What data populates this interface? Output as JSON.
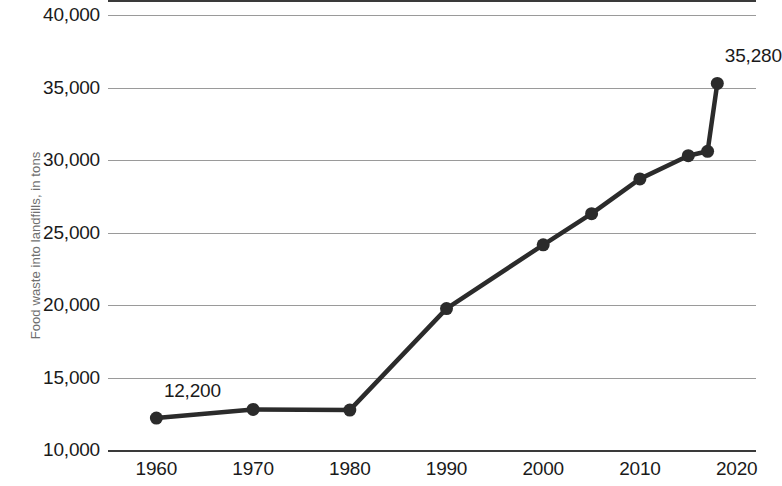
{
  "chart_data": {
    "type": "line",
    "title": "",
    "subtitle": "",
    "xlabel": "",
    "ylabel": "Food waste into landfills, in tons",
    "x": [
      1960,
      1970,
      1980,
      1990,
      2000,
      2005,
      2010,
      2015,
      2017,
      2018
    ],
    "values": [
      12200,
      12800,
      12750,
      19750,
      24150,
      26300,
      28700,
      30300,
      30600,
      35280
    ],
    "series": [
      {
        "name": "Food waste into landfills",
        "values": [
          12200,
          12800,
          12750,
          19750,
          24150,
          26300,
          28700,
          30300,
          30600,
          35280
        ]
      }
    ],
    "xlim": [
      1955,
      2022
    ],
    "ylim": [
      10000,
      40000
    ],
    "grid": true,
    "legend": false,
    "legend_position": "none",
    "line_color": "#2b2b2b",
    "marker": "circle",
    "y_ticks": [
      "10,000",
      "15,000",
      "20,000",
      "25,000",
      "30,000",
      "35,000",
      "40,000"
    ],
    "y_tick_values": [
      10000,
      15000,
      20000,
      25000,
      30000,
      35000,
      40000
    ],
    "x_ticks": [
      "1960",
      "1970",
      "1980",
      "1990",
      "2000",
      "2010",
      "2020"
    ],
    "x_tick_values": [
      1960,
      1970,
      1980,
      1990,
      2000,
      2010,
      2020
    ],
    "annotations": [
      {
        "label": "12,200",
        "x": 1960,
        "y": 12200
      },
      {
        "label": "35,280",
        "x": 2018,
        "y": 35280
      }
    ]
  },
  "colors": {
    "line": "#2b2b2b",
    "grid": "#9a9a9a",
    "axis": "#3a3a3a",
    "tick_text": "#1a1a1a",
    "axis_label": "#6f6f6f",
    "background": "#ffffff"
  }
}
